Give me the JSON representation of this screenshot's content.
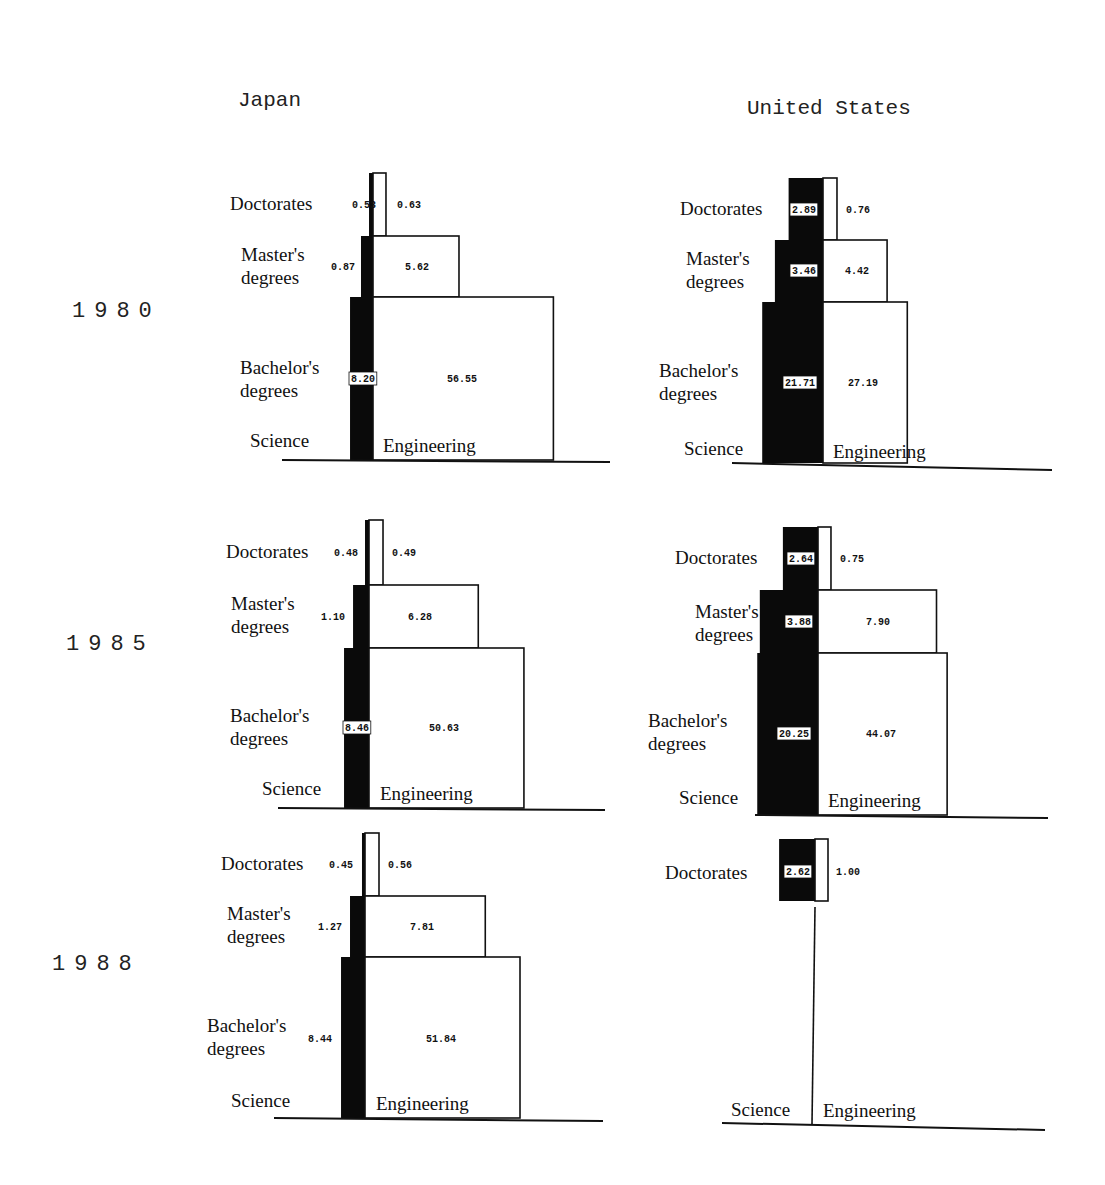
{
  "chart_data": {
    "type": "bar",
    "title": "",
    "xlabel": "",
    "ylabel": "",
    "countries": [
      "Japan",
      "United States"
    ],
    "years": [
      "1980",
      "1985",
      "1988"
    ],
    "levels": [
      "Doctorates",
      "Master's degrees",
      "Bachelor's degrees"
    ],
    "level_labels": {
      "doctorates": "Doctorates",
      "masters_line1": "Master's",
      "masters_line2": "degrees",
      "bachelors_line1": "Bachelor's",
      "bachelors_line2": "degrees"
    },
    "side_labels": {
      "science": "Science",
      "engineering": "Engineering"
    },
    "panels": [
      {
        "country": "Japan",
        "year": "1980",
        "science": {
          "doctorates": 0.53,
          "masters": 0.87,
          "bachelors": 8.2
        },
        "engineering": {
          "doctorates": 0.63,
          "masters": 5.62,
          "bachelors": 56.55
        },
        "labels": {
          "science": {
            "doctorates": "0.53",
            "masters": "0.87",
            "bachelors": "8.20"
          },
          "engineering": {
            "doctorates": "0.63",
            "masters": "5.62",
            "bachelors": "56.55"
          }
        }
      },
      {
        "country": "United States",
        "year": "1980",
        "science": {
          "doctorates": 2.89,
          "masters": 3.46,
          "bachelors": 21.71
        },
        "engineering": {
          "doctorates": 0.76,
          "masters": 4.42,
          "bachelors": 27.19
        },
        "labels": {
          "science": {
            "doctorates": "2.89",
            "masters": "3.46",
            "bachelors": "21.71"
          },
          "engineering": {
            "doctorates": "0.76",
            "masters": "4.42",
            "bachelors": "27.19"
          }
        }
      },
      {
        "country": "Japan",
        "year": "1985",
        "science": {
          "doctorates": 0.48,
          "masters": 1.1,
          "bachelors": 8.46
        },
        "engineering": {
          "doctorates": 0.49,
          "masters": 6.28,
          "bachelors": 50.63
        },
        "labels": {
          "science": {
            "doctorates": "0.48",
            "masters": "1.10",
            "bachelors": "8.46"
          },
          "engineering": {
            "doctorates": "0.49",
            "masters": "6.28",
            "bachelors": "50.63"
          }
        }
      },
      {
        "country": "United States",
        "year": "1985",
        "science": {
          "doctorates": 2.64,
          "masters": 3.88,
          "bachelors": 20.25
        },
        "engineering": {
          "doctorates": 0.75,
          "masters": 7.9,
          "bachelors": 44.07
        },
        "labels": {
          "science": {
            "doctorates": "2.64",
            "masters": "3.88",
            "bachelors": "20.25"
          },
          "engineering": {
            "doctorates": "0.75",
            "masters": "7.90",
            "bachelors": "44.07"
          }
        }
      },
      {
        "country": "Japan",
        "year": "1988",
        "science": {
          "doctorates": 0.45,
          "masters": 1.27,
          "bachelors": 8.44
        },
        "engineering": {
          "doctorates": 0.56,
          "masters": 7.81,
          "bachelors": 51.84
        },
        "labels": {
          "science": {
            "doctorates": "0.45",
            "masters": "1.27",
            "bachelors": "8.44"
          },
          "engineering": {
            "doctorates": "0.56",
            "masters": "7.81",
            "bachelors": "51.84"
          }
        }
      },
      {
        "country": "United States",
        "year": "1988",
        "science": {
          "doctorates": 2.62
        },
        "engineering": {
          "doctorates": 1.0
        },
        "labels": {
          "science": {
            "doctorates": "2.62"
          },
          "engineering": {
            "doctorates": "1.00"
          }
        }
      }
    ]
  }
}
